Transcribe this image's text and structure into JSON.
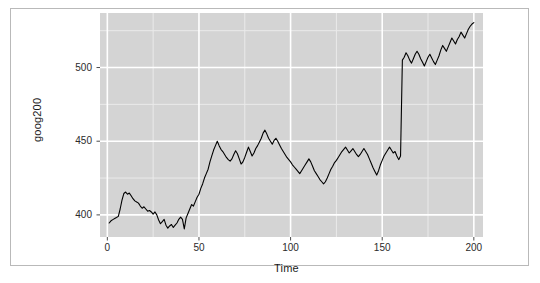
{
  "chart_data": {
    "type": "line",
    "title": "",
    "xlabel": "Time",
    "ylabel": "goog200",
    "xlim": [
      -4,
      205
    ],
    "ylim": [
      385,
      537
    ],
    "xticks": [
      0,
      50,
      100,
      150,
      200
    ],
    "yticks": [
      400,
      450,
      500
    ],
    "grid": true,
    "legend": "none",
    "series": [
      {
        "name": "goog200",
        "color": "#000000",
        "x": [
          1,
          2,
          3,
          4,
          5,
          6,
          7,
          8,
          9,
          10,
          11,
          12,
          13,
          14,
          15,
          16,
          17,
          18,
          19,
          20,
          21,
          22,
          23,
          24,
          25,
          26,
          27,
          28,
          29,
          30,
          31,
          32,
          33,
          34,
          35,
          36,
          37,
          38,
          39,
          40,
          41,
          42,
          43,
          44,
          45,
          46,
          47,
          48,
          49,
          50,
          51,
          52,
          53,
          54,
          55,
          56,
          57,
          58,
          59,
          60,
          61,
          62,
          63,
          64,
          65,
          66,
          67,
          68,
          69,
          70,
          71,
          72,
          73,
          74,
          75,
          76,
          77,
          78,
          79,
          80,
          81,
          82,
          83,
          84,
          85,
          86,
          87,
          88,
          89,
          90,
          91,
          92,
          93,
          94,
          95,
          96,
          97,
          98,
          99,
          100,
          101,
          102,
          103,
          104,
          105,
          106,
          107,
          108,
          109,
          110,
          111,
          112,
          113,
          114,
          115,
          116,
          117,
          118,
          119,
          120,
          121,
          122,
          123,
          124,
          125,
          126,
          127,
          128,
          129,
          130,
          131,
          132,
          133,
          134,
          135,
          136,
          137,
          138,
          139,
          140,
          141,
          142,
          143,
          144,
          145,
          146,
          147,
          148,
          149,
          150,
          151,
          152,
          153,
          154,
          155,
          156,
          157,
          158,
          159,
          160,
          161,
          162,
          163,
          164,
          165,
          166,
          167,
          168,
          169,
          170,
          171,
          172,
          173,
          174,
          175,
          176,
          177,
          178,
          179,
          180,
          181,
          182,
          183,
          184,
          185,
          186,
          187,
          188,
          189,
          190,
          191,
          192,
          193,
          194,
          195,
          196,
          197,
          198,
          199,
          200
        ],
        "y": [
          394.5,
          396.0,
          396.8,
          397.5,
          398.2,
          399.0,
          404.0,
          410.0,
          414.5,
          415.5,
          414.0,
          414.8,
          413.0,
          411.0,
          409.5,
          408.8,
          408.0,
          406.0,
          404.5,
          405.5,
          404.0,
          402.5,
          403.0,
          402.0,
          400.5,
          402.0,
          400.0,
          396.5,
          394.0,
          395.5,
          397.0,
          393.0,
          391.0,
          392.5,
          393.5,
          391.5,
          393.0,
          394.5,
          397.0,
          398.5,
          397.0,
          390.5,
          398.0,
          401.0,
          404.0,
          407.0,
          406.0,
          409.0,
          412.0,
          414.0,
          418.0,
          421.0,
          425.0,
          428.0,
          431.0,
          436.0,
          440.0,
          444.0,
          447.0,
          450.0,
          447.0,
          444.5,
          443.0,
          441.0,
          439.0,
          437.5,
          436.5,
          438.0,
          441.0,
          443.5,
          441.5,
          438.0,
          434.5,
          436.0,
          439.0,
          442.5,
          446.0,
          443.0,
          440.0,
          442.0,
          445.0,
          447.0,
          449.5,
          452.0,
          455.5,
          457.5,
          455.0,
          452.0,
          450.0,
          448.0,
          450.5,
          452.0,
          450.0,
          447.5,
          445.0,
          443.0,
          441.0,
          439.0,
          437.5,
          436.0,
          434.0,
          432.5,
          431.0,
          429.5,
          428.0,
          430.0,
          432.0,
          434.0,
          436.0,
          438.0,
          436.0,
          433.0,
          430.0,
          428.0,
          426.0,
          424.0,
          422.5,
          421.0,
          422.5,
          425.0,
          428.0,
          431.0,
          433.0,
          435.5,
          437.0,
          439.0,
          441.0,
          443.0,
          444.5,
          446.0,
          444.0,
          442.0,
          443.5,
          445.0,
          443.0,
          441.0,
          439.5,
          441.0,
          443.0,
          445.0,
          443.0,
          441.0,
          438.0,
          435.0,
          432.0,
          429.5,
          427.0,
          430.0,
          434.0,
          437.0,
          440.0,
          442.0,
          444.0,
          446.0,
          444.0,
          442.0,
          443.0,
          440.0,
          437.5,
          440.0,
          505.0,
          507.0,
          510.0,
          508.0,
          505.0,
          503.0,
          506.0,
          509.0,
          511.0,
          509.0,
          506.0,
          503.5,
          501.0,
          504.0,
          507.0,
          509.0,
          506.5,
          504.0,
          502.0,
          505.0,
          508.0,
          512.0,
          515.0,
          513.0,
          511.0,
          514.0,
          517.0,
          520.0,
          518.0,
          516.0,
          519.0,
          521.0,
          524.0,
          522.0,
          520.0,
          523.0,
          526.0,
          528.0,
          529.5,
          530.5
        ],
        "annotations": [
          {
            "label": "sharp-upward-jump",
            "x": 165,
            "from": 440.0,
            "to": 505.0
          }
        ]
      }
    ],
    "style": {
      "panel_background": "#d4d4d4",
      "major_gridline": "#ffffff",
      "minor_gridline": "#eaeaea",
      "line_color": "#000000",
      "text_color": "#1a1a1a",
      "frame_border": "#b9b9b9"
    }
  },
  "axes": {
    "x_title": "Time",
    "y_title": "goog200",
    "x_tick_labels": [
      "0",
      "50",
      "100",
      "150",
      "200"
    ],
    "y_tick_labels": [
      "400",
      "450",
      "500"
    ]
  }
}
